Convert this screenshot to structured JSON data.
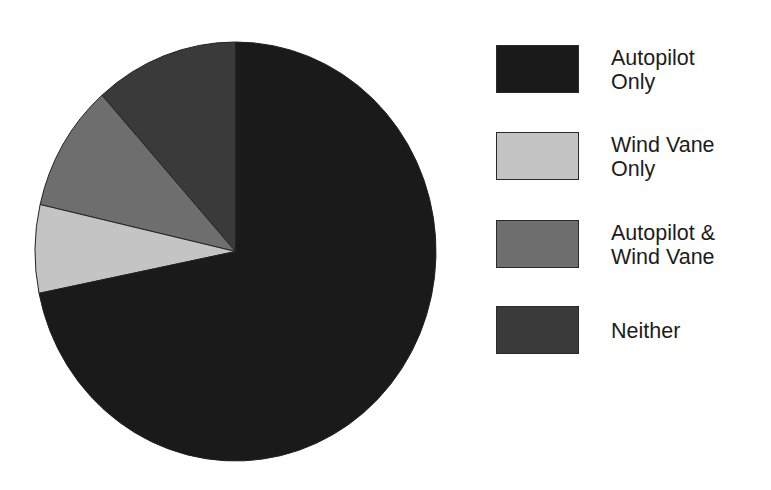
{
  "chart_data": {
    "type": "pie",
    "title": "",
    "start_angle_deg": 90,
    "direction": "counterclockwise",
    "slices": [
      {
        "label": "Autopilot Only",
        "value": 71.8,
        "color": "#1a1a1a"
      },
      {
        "label": "Wind Vane Only",
        "value": 6.8,
        "color": "#c4c4c4"
      },
      {
        "label": "Autopilot & Wind Vane",
        "value": 9.8,
        "color": "#6e6e6e"
      },
      {
        "label": "Neither",
        "value": 11.6,
        "color": "#3a3a3a"
      }
    ],
    "categories": [
      "Autopilot Only",
      "Wind Vane Only",
      "Autopilot & Wind Vane",
      "Neither"
    ],
    "values": [
      71.8,
      6.8,
      9.8,
      11.6
    ],
    "legend_position": "right",
    "data_labels": false
  },
  "legend": {
    "items": [
      {
        "label": "Autopilot\nOnly",
        "color": "#1a1a1a"
      },
      {
        "label": "Wind Vane\nOnly",
        "color": "#c4c4c4"
      },
      {
        "label": "Autopilot &\nWind Vane",
        "color": "#6e6e6e"
      },
      {
        "label": "Neither",
        "color": "#3a3a3a"
      }
    ]
  }
}
